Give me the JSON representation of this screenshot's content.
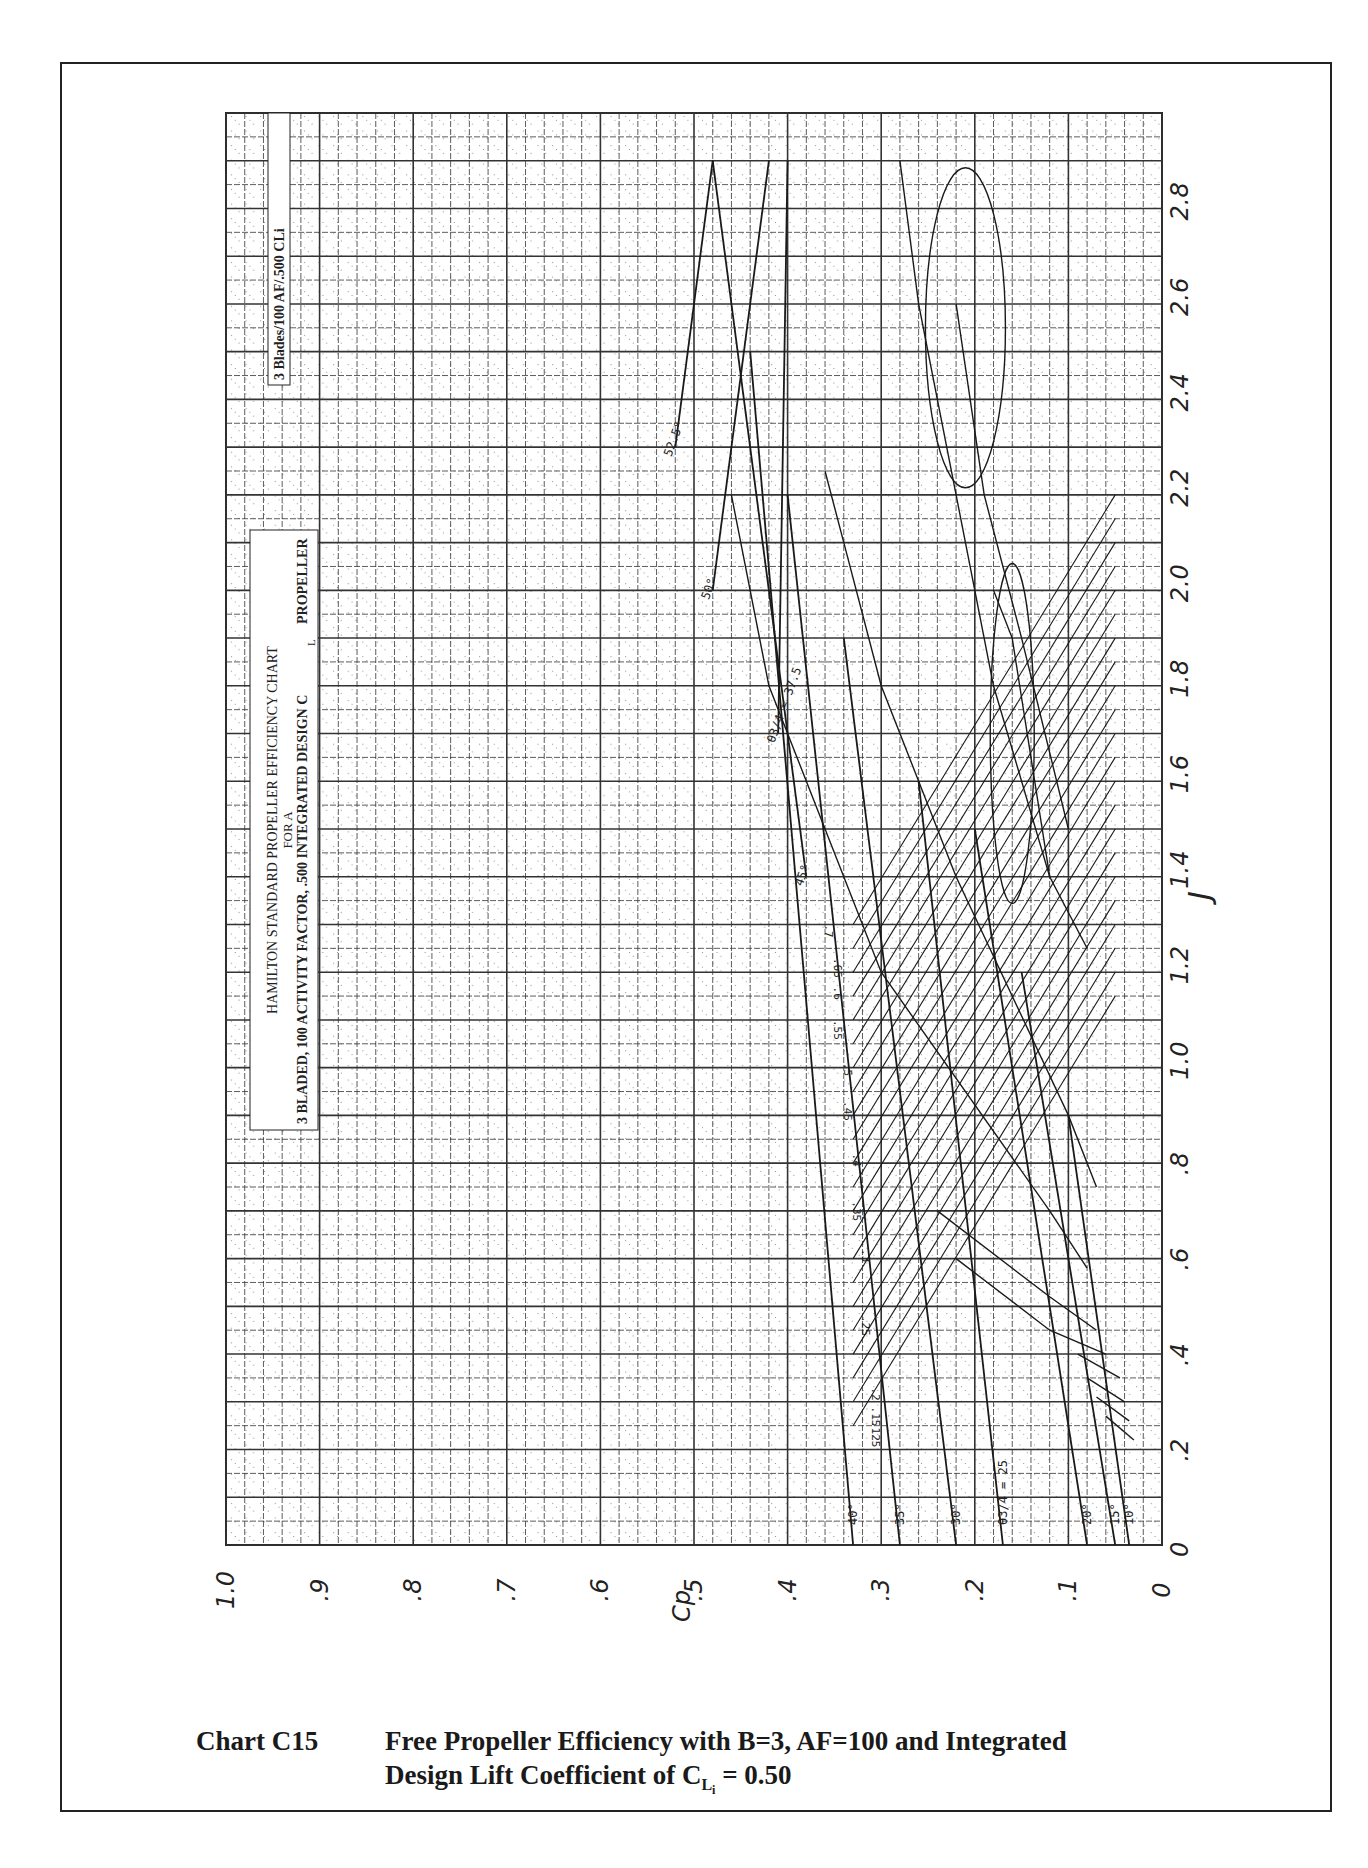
{
  "document": {
    "caption": {
      "number": "Chart C15",
      "line1": "Free Propeller Efficiency with B=3, AF=100 and Integrated",
      "line2_prefix": "Design Lift Coefficient of  C",
      "line2_sub": "L",
      "line2_subsub": "i",
      "line2_suffix": "  =  0.50"
    }
  },
  "chart_data": {
    "type": "line",
    "subtype": "contour / efficiency map",
    "orientation_note": "Chart printed rotated 90° on page: J axis runs bottom-to-top along right side, Cp axis runs right-to-left along bottom",
    "title_lines": [
      "HAMILTON STANDARD PROPELLER EFFICIENCY CHART",
      "FOR A",
      "3 BLADED, 100 ACTIVITY FACTOR, .500 INTEGRATED DESIGN C",
      "L",
      "PROPELLER"
    ],
    "corner_label": "3 Blades/100 AF/.500 CLi",
    "xlabel": "J",
    "ylabel": "Cp",
    "xlim": [
      0,
      3.0
    ],
    "ylim": [
      0,
      1.0
    ],
    "x_ticks": [
      "0",
      ".2",
      ".4",
      ".6",
      ".8",
      "1.0",
      "1.2",
      "1.4",
      "1.6",
      "1.8",
      "2.0",
      "2.2",
      "2.4",
      "2.6",
      "2.8"
    ],
    "y_ticks": [
      "1.0",
      ".9",
      ".8",
      ".7",
      ".6",
      ".5",
      ".4",
      ".3",
      ".2",
      ".1",
      "0"
    ],
    "grid": true,
    "legend": "none (curves labeled inline)",
    "efficiency_contour_labels": [
      ".125",
      ".15",
      ".20",
      ".25",
      ".30",
      ".35",
      ".40",
      ".45",
      ".50",
      ".55",
      ".60",
      ".65",
      ".70",
      ".75",
      ".80",
      ".85",
      ".90",
      ".905",
      ".91",
      ".50",
      ".55",
      ".60",
      ".65"
    ],
    "efficiency_contours": [
      {
        "eta": 0.5,
        "points": [
          [
            0.22,
            0.03
          ],
          [
            0.27,
            0.06
          ]
        ]
      },
      {
        "eta": 0.55,
        "points": [
          [
            0.26,
            0.035
          ],
          [
            0.31,
            0.07
          ]
        ]
      },
      {
        "eta": 0.6,
        "points": [
          [
            0.3,
            0.04
          ],
          [
            0.35,
            0.08
          ]
        ]
      },
      {
        "eta": 0.65,
        "points": [
          [
            0.35,
            0.045
          ],
          [
            0.4,
            0.09
          ]
        ]
      },
      {
        "eta": 0.7,
        "points": [
          [
            0.4,
            0.06
          ],
          [
            0.45,
            0.12
          ],
          [
            0.6,
            0.22
          ]
        ]
      },
      {
        "eta": 0.75,
        "points": [
          [
            0.45,
            0.07
          ],
          [
            0.52,
            0.12
          ],
          [
            0.7,
            0.24
          ]
        ]
      },
      {
        "eta": 0.8,
        "points": [
          [
            0.58,
            0.08
          ],
          [
            0.7,
            0.12
          ],
          [
            1.2,
            0.3
          ],
          [
            1.8,
            0.42
          ],
          [
            2.2,
            0.46
          ]
        ]
      },
      {
        "eta": 0.85,
        "points": [
          [
            0.75,
            0.07
          ],
          [
            0.9,
            0.1
          ],
          [
            1.4,
            0.22
          ],
          [
            1.8,
            0.3
          ],
          [
            2.1,
            0.34
          ],
          [
            2.25,
            0.36
          ]
        ]
      },
      {
        "eta": 0.9,
        "points": [
          [
            1.25,
            0.08
          ],
          [
            1.4,
            0.12
          ],
          [
            1.8,
            0.18
          ],
          [
            2.2,
            0.22
          ],
          [
            2.6,
            0.26
          ],
          [
            2.9,
            0.28
          ]
        ]
      },
      {
        "eta": 0.905,
        "points": [
          [
            1.5,
            0.1
          ],
          [
            1.9,
            0.15
          ],
          [
            2.2,
            0.19
          ],
          [
            2.6,
            0.22
          ]
        ]
      },
      {
        "eta": 0.91,
        "points": [
          [
            1.4,
            0.12
          ],
          [
            1.9,
            0.16
          ],
          [
            2.0,
            0.18
          ]
        ]
      }
    ],
    "left_edge_eta_labels_cp_0.3_to_0.4": [
      {
        "eta": 0.125,
        "J": 0.26,
        "Cp": 0.31
      },
      {
        "eta": 0.15,
        "J": 0.29,
        "Cp": 0.31
      },
      {
        "eta": 0.2,
        "J": 0.33,
        "Cp": 0.31
      },
      {
        "eta": 0.25,
        "J": 0.48,
        "Cp": 0.32
      },
      {
        "eta": 0.3,
        "J": 0.62,
        "Cp": 0.32
      },
      {
        "eta": 0.35,
        "J": 0.72,
        "Cp": 0.33
      },
      {
        "eta": 0.4,
        "J": 0.82,
        "Cp": 0.33
      },
      {
        "eta": 0.45,
        "J": 0.93,
        "Cp": 0.34
      },
      {
        "eta": 0.5,
        "J": 1.01,
        "Cp": 0.34
      },
      {
        "eta": 0.55,
        "J": 1.1,
        "Cp": 0.35
      },
      {
        "eta": 0.6,
        "J": 1.17,
        "Cp": 0.35
      },
      {
        "eta": 0.65,
        "J": 1.23,
        "Cp": 0.35
      },
      {
        "eta": 0.7,
        "J": 1.3,
        "Cp": 0.36
      }
    ],
    "blade_angle_label": "θ3/4",
    "blade_angle_lines": [
      {
        "beta": 10,
        "points": [
          [
            0.0,
            0.035
          ],
          [
            0.9,
            0.1
          ]
        ]
      },
      {
        "beta": 15,
        "points": [
          [
            0.0,
            0.05
          ],
          [
            1.2,
            0.15
          ]
        ]
      },
      {
        "beta": 20,
        "points": [
          [
            0.0,
            0.08
          ],
          [
            1.5,
            0.2
          ]
        ]
      },
      {
        "beta": 25,
        "label": "θ3/4 = 25",
        "points": [
          [
            0.0,
            0.17
          ],
          [
            1.6,
            0.26
          ]
        ]
      },
      {
        "beta": 30,
        "points": [
          [
            0.0,
            0.22
          ],
          [
            1.9,
            0.34
          ]
        ]
      },
      {
        "beta": 35,
        "points": [
          [
            0.0,
            0.28
          ],
          [
            2.2,
            0.4
          ]
        ]
      },
      {
        "beta": 40,
        "points": [
          [
            0.0,
            0.33
          ],
          [
            2.5,
            0.44
          ]
        ]
      },
      {
        "beta": 45,
        "points": [
          [
            1.4,
            0.38
          ],
          [
            2.9,
            0.48
          ]
        ]
      },
      {
        "beta": 37.5,
        "label": "θ3/4 = 37.5",
        "points": [
          [
            1.7,
            0.41
          ],
          [
            2.9,
            0.4
          ]
        ]
      },
      {
        "beta": 50,
        "points": [
          [
            2.0,
            0.48
          ],
          [
            2.9,
            0.42
          ]
        ]
      },
      {
        "beta": 52.5,
        "points": [
          [
            2.3,
            0.52
          ],
          [
            2.9,
            0.48
          ]
        ]
      }
    ],
    "peak_efficiency_region": {
      "eta": 0.91,
      "J_range": [
        1.4,
        2.0
      ],
      "Cp_range": [
        0.12,
        0.2
      ]
    }
  }
}
